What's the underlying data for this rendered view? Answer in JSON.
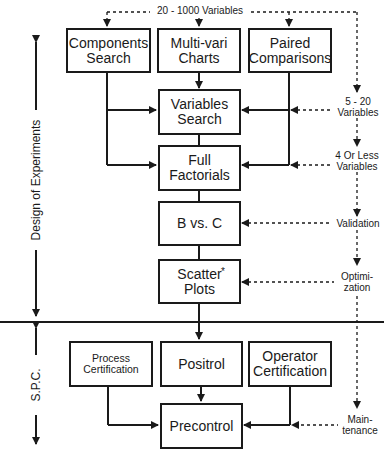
{
  "diagram": {
    "top_label": "20 - 1000 Variables",
    "sections": {
      "doe": "Design of Experiments",
      "spc": "S.P.C."
    },
    "boxes": {
      "components_search": "Components\nSearch",
      "multi_vari": "Multi-vari\nCharts",
      "paired_comparisons": "Paired\nComparisons",
      "variables_search": "Variables\nSearch",
      "full_factorials": "Full\nFactorials",
      "b_vs_c": "B vs. C",
      "scatter_plots": "Scatter\nPlots",
      "scatter_asterisk": "*",
      "process_certification": "Process\nCertification",
      "positrol": "Positrol",
      "operator_certification": "Operator\nCertification",
      "precontrol": "Precontrol"
    },
    "side_labels": {
      "five_twenty": "5 - 20\nVariables",
      "four_or_less": "4 Or Less\nVariables",
      "validation": "Validation",
      "optimization": "Optimi-\nzation",
      "maintenance": "Main-\ntenance"
    }
  }
}
